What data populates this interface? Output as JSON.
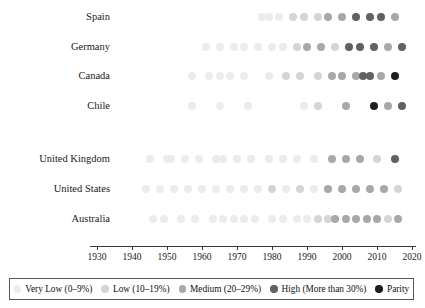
{
  "chart_data": {
    "type": "scatter",
    "title": "",
    "xlabel": "",
    "ylabel": "",
    "xlim": [
      1928,
      2021
    ],
    "xticks": [
      1930,
      1940,
      1950,
      1960,
      1970,
      1980,
      1990,
      2000,
      2010,
      2020
    ],
    "xtick_labels": [
      "1930",
      "1940",
      "1950",
      "1960",
      "1970",
      "1980",
      "1990",
      "2000",
      "2010",
      "2020"
    ],
    "grid": false,
    "legend_position": "bottom",
    "categories": [
      "Very Low (0–9%)",
      "Low (10–19%)",
      "Medium (20–29%)",
      "High (More than 30%)",
      "Parity"
    ],
    "category_colors": [
      "#ececec",
      "#d5d5d5",
      "#a8a8a8",
      "#616161",
      "#1e1e1e"
    ],
    "series": [
      {
        "name": "Spain",
        "group": 1,
        "points": [
          {
            "x": 1977,
            "category": 0
          },
          {
            "x": 1979,
            "category": 0
          },
          {
            "x": 1982,
            "category": 0
          },
          {
            "x": 1986,
            "category": 1
          },
          {
            "x": 1989,
            "category": 1
          },
          {
            "x": 1993,
            "category": 1
          },
          {
            "x": 1996,
            "category": 2
          },
          {
            "x": 2000,
            "category": 2
          },
          {
            "x": 2004,
            "category": 3
          },
          {
            "x": 2008,
            "category": 3
          },
          {
            "x": 2011,
            "category": 3
          },
          {
            "x": 2015,
            "category": 2
          }
        ]
      },
      {
        "name": "Germany",
        "group": 1,
        "points": [
          {
            "x": 1961,
            "category": 0
          },
          {
            "x": 1965,
            "category": 0
          },
          {
            "x": 1969,
            "category": 0
          },
          {
            "x": 1972,
            "category": 0
          },
          {
            "x": 1976,
            "category": 0
          },
          {
            "x": 1980,
            "category": 0
          },
          {
            "x": 1983,
            "category": 0
          },
          {
            "x": 1987,
            "category": 1
          },
          {
            "x": 1990,
            "category": 2
          },
          {
            "x": 1994,
            "category": 2
          },
          {
            "x": 1998,
            "category": 1
          },
          {
            "x": 2002,
            "category": 3
          },
          {
            "x": 2005,
            "category": 3
          },
          {
            "x": 2009,
            "category": 3
          },
          {
            "x": 2013,
            "category": 2
          },
          {
            "x": 2017,
            "category": 3
          }
        ]
      },
      {
        "name": "Canada",
        "group": 1,
        "points": [
          {
            "x": 1957,
            "category": 0
          },
          {
            "x": 1962,
            "category": 0
          },
          {
            "x": 1965,
            "category": 0
          },
          {
            "x": 1968,
            "category": 0
          },
          {
            "x": 1972,
            "category": 0
          },
          {
            "x": 1979,
            "category": 0
          },
          {
            "x": 1984,
            "category": 1
          },
          {
            "x": 1988,
            "category": 1
          },
          {
            "x": 1993,
            "category": 1
          },
          {
            "x": 1997,
            "category": 2
          },
          {
            "x": 2000,
            "category": 2
          },
          {
            "x": 2004,
            "category": 2
          },
          {
            "x": 2006,
            "category": 3
          },
          {
            "x": 2008,
            "category": 3
          },
          {
            "x": 2011,
            "category": 2
          },
          {
            "x": 2015,
            "category": 4
          }
        ]
      },
      {
        "name": "Chile",
        "group": 1,
        "points": [
          {
            "x": 1957,
            "category": 0
          },
          {
            "x": 1965,
            "category": 0
          },
          {
            "x": 1973,
            "category": 0
          },
          {
            "x": 1989,
            "category": 0
          },
          {
            "x": 1993,
            "category": 1
          },
          {
            "x": 2001,
            "category": 2
          },
          {
            "x": 2009,
            "category": 4
          },
          {
            "x": 2013,
            "category": 2
          },
          {
            "x": 2017,
            "category": 3
          }
        ]
      },
      {
        "name": "United Kingdom",
        "group": 2,
        "points": [
          {
            "x": 1945,
            "category": 0
          },
          {
            "x": 1950,
            "category": 0
          },
          {
            "x": 1951,
            "category": 0
          },
          {
            "x": 1955,
            "category": 0
          },
          {
            "x": 1959,
            "category": 0
          },
          {
            "x": 1964,
            "category": 0
          },
          {
            "x": 1966,
            "category": 0
          },
          {
            "x": 1970,
            "category": 0
          },
          {
            "x": 1974,
            "category": 0
          },
          {
            "x": 1979,
            "category": 0
          },
          {
            "x": 1983,
            "category": 0
          },
          {
            "x": 1987,
            "category": 0
          },
          {
            "x": 1992,
            "category": 0
          },
          {
            "x": 1997,
            "category": 2
          },
          {
            "x": 2001,
            "category": 2
          },
          {
            "x": 2005,
            "category": 2
          },
          {
            "x": 2010,
            "category": 1
          },
          {
            "x": 2015,
            "category": 3
          }
        ]
      },
      {
        "name": "United States",
        "group": 2,
        "points": [
          {
            "x": 1944,
            "category": 0
          },
          {
            "x": 1948,
            "category": 0
          },
          {
            "x": 1952,
            "category": 0
          },
          {
            "x": 1956,
            "category": 0
          },
          {
            "x": 1960,
            "category": 0
          },
          {
            "x": 1964,
            "category": 0
          },
          {
            "x": 1968,
            "category": 0
          },
          {
            "x": 1972,
            "category": 0
          },
          {
            "x": 1976,
            "category": 0
          },
          {
            "x": 1980,
            "category": 1
          },
          {
            "x": 1984,
            "category": 0
          },
          {
            "x": 1988,
            "category": 1
          },
          {
            "x": 1992,
            "category": 0
          },
          {
            "x": 1996,
            "category": 2
          },
          {
            "x": 2000,
            "category": 2
          },
          {
            "x": 2004,
            "category": 2
          },
          {
            "x": 2008,
            "category": 2
          },
          {
            "x": 2012,
            "category": 2
          },
          {
            "x": 2016,
            "category": 1
          }
        ]
      },
      {
        "name": "Australia",
        "group": 2,
        "points": [
          {
            "x": 1946,
            "category": 0
          },
          {
            "x": 1949,
            "category": 0
          },
          {
            "x": 1954,
            "category": 0
          },
          {
            "x": 1958,
            "category": 0
          },
          {
            "x": 1963,
            "category": 0
          },
          {
            "x": 1966,
            "category": 0
          },
          {
            "x": 1969,
            "category": 0
          },
          {
            "x": 1972,
            "category": 0
          },
          {
            "x": 1975,
            "category": 0
          },
          {
            "x": 1980,
            "category": 0
          },
          {
            "x": 1983,
            "category": 0
          },
          {
            "x": 1987,
            "category": 0
          },
          {
            "x": 1990,
            "category": 0
          },
          {
            "x": 1993,
            "category": 1
          },
          {
            "x": 1996,
            "category": 1
          },
          {
            "x": 1998,
            "category": 2
          },
          {
            "x": 2001,
            "category": 2
          },
          {
            "x": 2004,
            "category": 2
          },
          {
            "x": 2007,
            "category": 2
          },
          {
            "x": 2010,
            "category": 2
          },
          {
            "x": 2013,
            "category": 1
          },
          {
            "x": 2016,
            "category": 2
          }
        ]
      }
    ]
  }
}
